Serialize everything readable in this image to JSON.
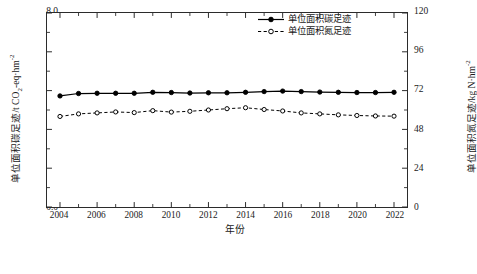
{
  "chart_data": {
    "type": "line",
    "title": "",
    "xlabel": "年份",
    "ylabel": "单位面积碳足迹/t CO2-eq·hm-2",
    "ylabel_right": "单位面积氮足迹/kg N·hm-2",
    "x": [
      2004,
      2005,
      2006,
      2007,
      2008,
      2009,
      2010,
      2011,
      2012,
      2013,
      2014,
      2015,
      2016,
      2017,
      2018,
      2019,
      2020,
      2021,
      2022
    ],
    "xtick_labels": [
      "2004",
      "2006",
      "2008",
      "2010",
      "2012",
      "2014",
      "2016",
      "2018",
      "2020",
      "2022"
    ],
    "xlim": [
      2003.3,
      2022.7
    ],
    "ylim": [
      0.0,
      8.0
    ],
    "ytick_labels": [
      "0.0",
      "1.6",
      "3.2",
      "4.8",
      "6.4",
      "8.0"
    ],
    "ytick_values": [
      0.0,
      1.6,
      3.2,
      4.8,
      6.4,
      8.0
    ],
    "ylim_right": [
      0,
      120
    ],
    "ytick_labels_right": [
      "0",
      "24",
      "48",
      "72",
      "96",
      "120"
    ],
    "ytick_values_right": [
      0,
      24,
      48,
      72,
      96,
      120
    ],
    "grid": false,
    "legend_position": "top-right",
    "series": [
      {
        "name": "单位面积碳足迹",
        "axis": "left",
        "style": "solid",
        "marker": "filled-circle",
        "color": "#000000",
        "values": [
          4.58,
          4.68,
          4.69,
          4.69,
          4.69,
          4.73,
          4.72,
          4.7,
          4.71,
          4.71,
          4.73,
          4.76,
          4.78,
          4.76,
          4.74,
          4.73,
          4.72,
          4.72,
          4.73
        ]
      },
      {
        "name": "单位面积氮足迹",
        "axis": "right",
        "style": "dashed",
        "marker": "open-circle",
        "color": "#000000",
        "values": [
          56.0,
          57.6,
          58.2,
          58.8,
          58.4,
          59.6,
          58.7,
          59.2,
          60.0,
          60.8,
          61.4,
          60.3,
          59.4,
          58.2,
          57.6,
          57.0,
          56.6,
          56.3,
          56.2
        ]
      }
    ]
  },
  "legend": {
    "items": [
      {
        "label": "单位面积碳足迹"
      },
      {
        "label": "单位面积氮足迹"
      }
    ]
  },
  "axis_titles": {
    "x": "年份",
    "y_left_pre": "单位面积碳足迹/t CO",
    "y_left_sub": "2",
    "y_left_mid": "-eq·hm",
    "y_left_sup": "-2",
    "y_right_pre": "单位面积氮足迹/kg N·hm",
    "y_right_sup": "-2"
  },
  "caption": {
    "text": ""
  }
}
